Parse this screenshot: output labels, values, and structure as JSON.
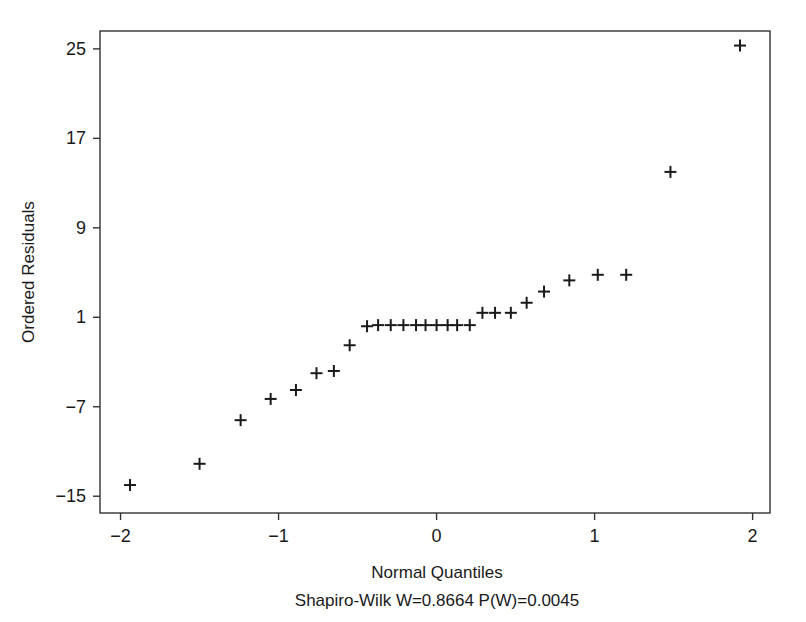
{
  "chart_data": {
    "type": "scatter",
    "title": "",
    "subtitle": "",
    "xlabel": "Normal Quantiles",
    "ylabel": "Ordered Residuals",
    "annotation": "Shapiro-Wilk W=0.8664 P(W)=0.0045",
    "shapiro_wilk": {
      "W": "0.8664",
      "P": "0.0045"
    },
    "grid": false,
    "legend": "none",
    "marker": "plus",
    "marker_color": "#1a1a1a",
    "xlim": [
      -2.13,
      2.11
    ],
    "ylim": [
      -16.5,
      26.6
    ],
    "xticks": [
      -2,
      -1,
      0,
      1,
      2
    ],
    "xticklabels": [
      "−2",
      "−1",
      "0",
      "1",
      "2"
    ],
    "yticks": [
      25,
      17,
      9,
      1,
      -7,
      -15
    ],
    "yticklabels": [
      "25",
      "17",
      "9",
      "1",
      "−7",
      "−15"
    ],
    "x": [
      -1.94,
      -1.5,
      -1.24,
      -1.05,
      -0.89,
      -0.76,
      -0.65,
      -0.55,
      -0.44,
      -0.37,
      -0.29,
      -0.21,
      -0.13,
      -0.07,
      0.0,
      0.07,
      0.13,
      0.21,
      0.29,
      0.37,
      0.47,
      0.57,
      0.68,
      0.84,
      1.02,
      1.2,
      1.48,
      1.92
    ],
    "y": [
      -14.0,
      -12.1,
      -8.2,
      -6.3,
      -5.5,
      -4.0,
      -3.8,
      -1.5,
      0.2,
      0.3,
      0.3,
      0.3,
      0.3,
      0.3,
      0.3,
      0.3,
      0.3,
      0.3,
      1.4,
      1.4,
      1.4,
      2.3,
      3.3,
      4.3,
      4.8,
      4.8,
      14.0,
      25.3
    ],
    "n_points": 28
  },
  "figure": {
    "background": "#ffffff",
    "axis_color": "#333333",
    "text_color": "#1a1a1a"
  }
}
